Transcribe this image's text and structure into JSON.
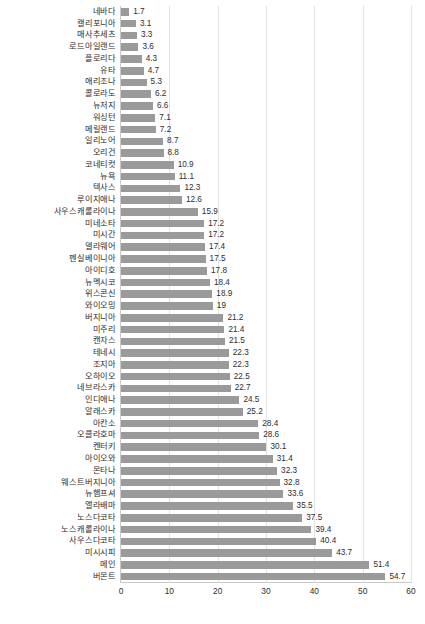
{
  "chart_data": {
    "type": "bar",
    "orientation": "horizontal",
    "title": "",
    "subtitle": "",
    "xlabel": "",
    "ylabel": "",
    "xlim": [
      0,
      60
    ],
    "xticks": [
      0,
      10,
      20,
      30,
      40,
      50,
      60
    ],
    "grid": true,
    "gridlines": "vertical",
    "legend": false,
    "legend_position": "none",
    "bar_color": "#9a9a9a",
    "axis_color": "#c9c9c9",
    "gridline_color": "#e2e2e2",
    "text_color": "#2e2e2e",
    "data_labels": true,
    "sort_order": "ascending",
    "categories": [
      "네바다",
      "캘리포니아",
      "매사추세츠",
      "로드아일랜드",
      "플로리다",
      "유타",
      "애리조나",
      "콜로라도",
      "뉴저지",
      "워싱턴",
      "메릴랜드",
      "일리노어",
      "오리건",
      "코네티컷",
      "뉴욕",
      "텍사스",
      "루이지애나",
      "사우스캐롤라이나",
      "미네소타",
      "미시간",
      "델라웨어",
      "펜실베이니아",
      "아이디호",
      "뉴멕시코",
      "위스콘신",
      "와이오밍",
      "버지니아",
      "미주리",
      "캔자스",
      "테네시",
      "조지아",
      "오하이오",
      "네브라스카",
      "인디애나",
      "알래스카",
      "아칸소",
      "오클라호마",
      "켄터키",
      "아이오와",
      "몬타나",
      "웨스트버지니아",
      "뉴햄프셔",
      "앨라배마",
      "노스다코타",
      "노스캐롤라이나",
      "사우스다코타",
      "미시시피",
      "메인",
      "버몬트"
    ],
    "values": [
      1.7,
      3.1,
      3.3,
      3.6,
      4.3,
      4.7,
      5.3,
      6.2,
      6.6,
      7.1,
      7.2,
      8.7,
      8.8,
      10.9,
      11.1,
      12.3,
      12.6,
      15.9,
      17.2,
      17.2,
      17.4,
      17.5,
      17.8,
      18.4,
      18.9,
      19,
      21.2,
      21.4,
      21.5,
      22.3,
      22.3,
      22.5,
      22.7,
      24.5,
      25.2,
      28.4,
      28.6,
      30.1,
      31.4,
      32.3,
      32.8,
      33.6,
      35.5,
      37.5,
      39.4,
      40.4,
      43.7,
      51.4,
      54.7
    ],
    "value_labels": [
      "1.7",
      "3.1",
      "3.3",
      "3.6",
      "4.3",
      "4.7",
      "5.3",
      "6.2",
      "6.6",
      "7.1",
      "7.2",
      "8.7",
      "8.8",
      "10.9",
      "11.1",
      "12.3",
      "12.6",
      "15.9",
      "17.2",
      "17.2",
      "17.4",
      "17.5",
      "17.8",
      "18.4",
      "18.9",
      "19",
      "21.2",
      "21.4",
      "21.5",
      "22.3",
      "22.3",
      "22.5",
      "22.7",
      "24.5",
      "25.2",
      "28.4",
      "28.6",
      "30.1",
      "31.4",
      "32.3",
      "32.8",
      "33.6",
      "35.5",
      "37.5",
      "39.4",
      "40.4",
      "43.7",
      "51.4",
      "54.7"
    ],
    "xtick_labels": [
      "0",
      "10",
      "20",
      "30",
      "40",
      "50",
      "60"
    ]
  }
}
